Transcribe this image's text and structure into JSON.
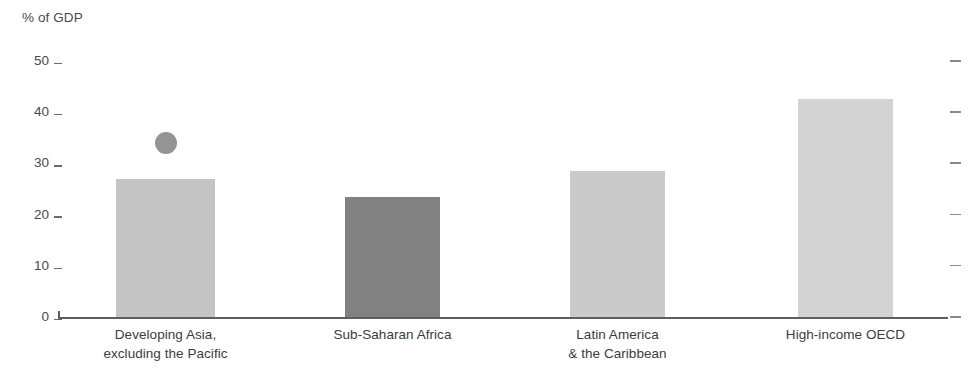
{
  "chart_data": {
    "type": "bar",
    "title": "",
    "subtitle": "",
    "xlabel": "",
    "ylabel": "% of GDP",
    "ylim": [
      0,
      50
    ],
    "grid": false,
    "legend": "none",
    "y_ticks": [
      50,
      40,
      30,
      20,
      10,
      0
    ],
    "y_tick_labels": [
      "50",
      "40",
      "30",
      "20",
      "10",
      "0"
    ],
    "right_axis_ticks": [
      50,
      40,
      30,
      20,
      10,
      0
    ],
    "categories": [
      "Developing Asia, excluding the Pacific",
      "Sub-Saharan Africa",
      "Latin America & the Caribbean",
      "High-income OECD"
    ],
    "category_label_lines": [
      [
        "Developing Asia,",
        "excluding the Pacific"
      ],
      [
        "Sub-Saharan Africa"
      ],
      [
        "Latin America",
        "& the Caribbean"
      ],
      [
        "High-income OECD"
      ]
    ],
    "values": [
      27.0,
      23.5,
      28.5,
      42.5
    ],
    "bar_colors": [
      "#c4c4c4",
      "#818181",
      "#cacaca",
      "#d3d3d3"
    ],
    "annotations": [
      {
        "type": "point-marker",
        "shape": "circle",
        "category": "Developing Asia, excluding the Pacific",
        "value": 34.0,
        "color": "#949494"
      }
    ]
  },
  "axis": {
    "unit_label": "% of GDP"
  },
  "colors": {
    "axis_line": "#5e5e5e",
    "tick_mark": "#6b6b6b",
    "right_tick_mark": "#8a8a8a",
    "text": "#3c3c3c",
    "background": "#ffffff"
  }
}
